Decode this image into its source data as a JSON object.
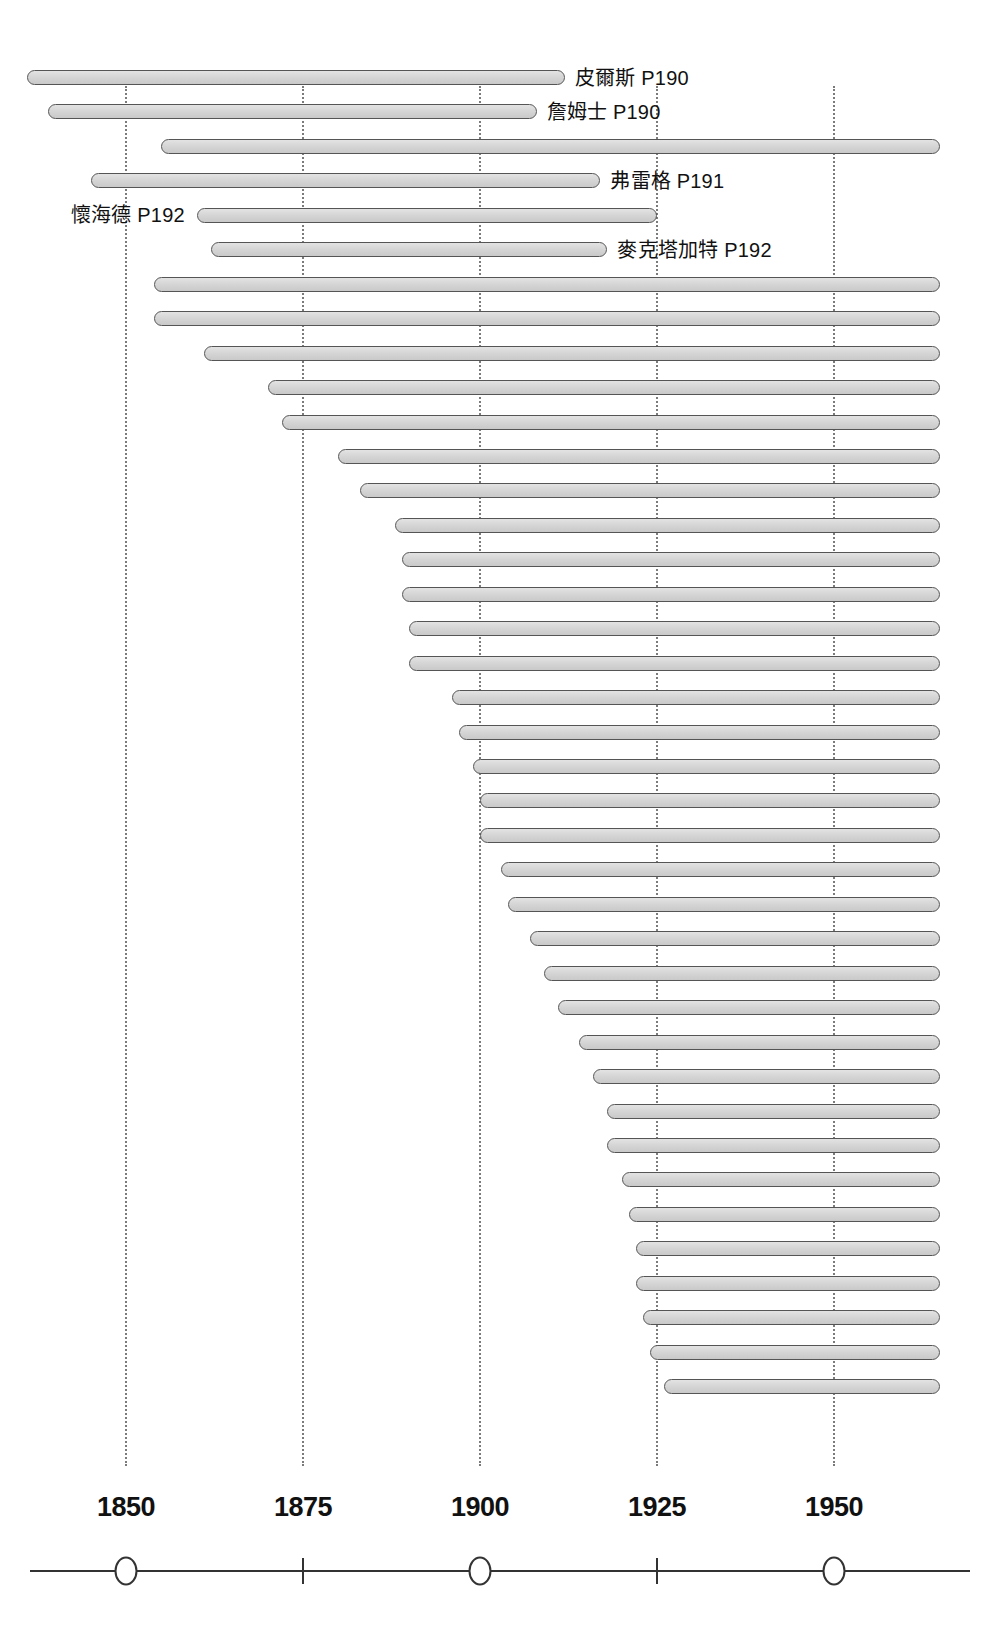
{
  "chart_data": {
    "type": "bar",
    "title": "",
    "subtitle": "",
    "xlabel": "",
    "ylabel": "",
    "orientation": "horizontal",
    "grid": true,
    "legend_position": "none",
    "xlim": [
      1832,
      1965
    ],
    "axis": {
      "tick_labels": [
        "1850",
        "1875",
        "1900",
        "1925",
        "1950"
      ],
      "tick_values": [
        1850,
        1875,
        1900,
        1925,
        1950
      ],
      "tick_markers": [
        "circle",
        "line",
        "circle",
        "line",
        "circle"
      ]
    },
    "bar_color": "#d6d6d6",
    "bar_outline_color": "#555555",
    "gridline_color": "#7b7b7b",
    "axis_color": "#333333",
    "bars": [
      {
        "label": "皮爾斯 P190",
        "label_side": "right",
        "start": 1836,
        "end": 1912
      },
      {
        "label": "詹姆士 P190",
        "label_side": "right",
        "start": 1839,
        "end": 1908
      },
      {
        "label": "",
        "label_side": "none",
        "start": 1855,
        "end": 1965
      },
      {
        "label": "弗雷格 P191",
        "label_side": "right",
        "start": 1845,
        "end": 1917
      },
      {
        "label": "懷海德 P192",
        "label_side": "left",
        "start": 1860,
        "end": 1925
      },
      {
        "label": "麥克塔加特 P192",
        "label_side": "right",
        "start": 1862,
        "end": 1918
      },
      {
        "label": "",
        "label_side": "none",
        "start": 1854,
        "end": 1965
      },
      {
        "label": "",
        "label_side": "none",
        "start": 1854,
        "end": 1965
      },
      {
        "label": "",
        "label_side": "none",
        "start": 1861,
        "end": 1965
      },
      {
        "label": "",
        "label_side": "none",
        "start": 1870,
        "end": 1965
      },
      {
        "label": "",
        "label_side": "none",
        "start": 1872,
        "end": 1965
      },
      {
        "label": "",
        "label_side": "none",
        "start": 1880,
        "end": 1965
      },
      {
        "label": "",
        "label_side": "none",
        "start": 1883,
        "end": 1965
      },
      {
        "label": "",
        "label_side": "none",
        "start": 1888,
        "end": 1965
      },
      {
        "label": "",
        "label_side": "none",
        "start": 1889,
        "end": 1965
      },
      {
        "label": "",
        "label_side": "none",
        "start": 1889,
        "end": 1965
      },
      {
        "label": "",
        "label_side": "none",
        "start": 1890,
        "end": 1965
      },
      {
        "label": "",
        "label_side": "none",
        "start": 1890,
        "end": 1965
      },
      {
        "label": "",
        "label_side": "none",
        "start": 1896,
        "end": 1965
      },
      {
        "label": "",
        "label_side": "none",
        "start": 1897,
        "end": 1965
      },
      {
        "label": "",
        "label_side": "none",
        "start": 1899,
        "end": 1965
      },
      {
        "label": "",
        "label_side": "none",
        "start": 1900,
        "end": 1965
      },
      {
        "label": "",
        "label_side": "none",
        "start": 1900,
        "end": 1965
      },
      {
        "label": "",
        "label_side": "none",
        "start": 1903,
        "end": 1965
      },
      {
        "label": "",
        "label_side": "none",
        "start": 1904,
        "end": 1965
      },
      {
        "label": "",
        "label_side": "none",
        "start": 1907,
        "end": 1965
      },
      {
        "label": "",
        "label_side": "none",
        "start": 1909,
        "end": 1965
      },
      {
        "label": "",
        "label_side": "none",
        "start": 1911,
        "end": 1965
      },
      {
        "label": "",
        "label_side": "none",
        "start": 1914,
        "end": 1965
      },
      {
        "label": "",
        "label_side": "none",
        "start": 1916,
        "end": 1965
      },
      {
        "label": "",
        "label_side": "none",
        "start": 1918,
        "end": 1965
      },
      {
        "label": "",
        "label_side": "none",
        "start": 1918,
        "end": 1965
      },
      {
        "label": "",
        "label_side": "none",
        "start": 1920,
        "end": 1965
      },
      {
        "label": "",
        "label_side": "none",
        "start": 1921,
        "end": 1965
      },
      {
        "label": "",
        "label_side": "none",
        "start": 1922,
        "end": 1965
      },
      {
        "label": "",
        "label_side": "none",
        "start": 1922,
        "end": 1965
      },
      {
        "label": "",
        "label_side": "none",
        "start": 1923,
        "end": 1965
      },
      {
        "label": "",
        "label_side": "none",
        "start": 1924,
        "end": 1965
      },
      {
        "label": "",
        "label_side": "none",
        "start": 1926,
        "end": 1965
      }
    ]
  }
}
